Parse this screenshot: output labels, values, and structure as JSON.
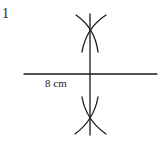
{
  "question_number": "1",
  "segment_label": "8 cm",
  "construction": {
    "type": "perpendicular-bisector",
    "segment": {
      "x1": 24,
      "y1": 74,
      "x2": 157,
      "y2": 74
    },
    "bisector": {
      "x1": 90,
      "y1": 14,
      "x2": 90,
      "y2": 135
    },
    "upper_intersection": {
      "x": 90,
      "y": 32
    },
    "lower_intersection": {
      "x": 90,
      "y": 117
    },
    "stroke_color": "#1a1a1a"
  }
}
